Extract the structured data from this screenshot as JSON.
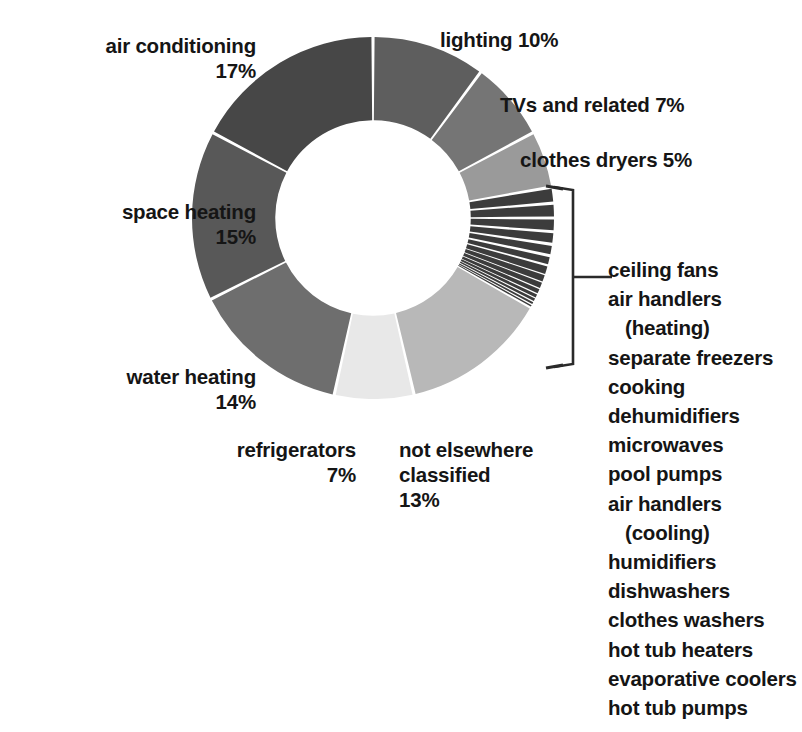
{
  "chart_data": {
    "type": "pie",
    "title": "",
    "subtitle": "",
    "xlabel": "",
    "ylabel": "",
    "donut": true,
    "inner_radius_ratio": 0.54,
    "start_angle_deg": 0,
    "direction": "clockwise",
    "units": "percent",
    "legend_position": "labels-around-chart",
    "grid": false,
    "categories": [
      "lighting",
      "TVs and related",
      "clothes dryers",
      "ceiling fans",
      "air handlers (heating)",
      "separate freezers",
      "cooking",
      "dehumidifiers",
      "microwaves",
      "pool pumps",
      "air handlers (cooling)",
      "humidifiers",
      "dishwashers",
      "clothes washers",
      "hot tub heaters",
      "evaporative coolers",
      "hot tub pumps",
      "not elsewhere classified",
      "refrigerators",
      "water heating",
      "space heating",
      "air conditioning"
    ],
    "values": [
      10,
      7,
      5,
      1.4,
      1.3,
      1.2,
      1.1,
      1.0,
      0.9,
      0.8,
      0.7,
      0.6,
      0.5,
      0.4,
      0.35,
      0.3,
      0.25,
      13,
      7,
      14,
      15,
      17
    ],
    "colors": [
      "#5e5e5e",
      "#757575",
      "#9a9a9a",
      "#3c3c3c",
      "#3c3c3c",
      "#3c3c3c",
      "#3c3c3c",
      "#3c3c3c",
      "#3c3c3c",
      "#3c3c3c",
      "#3c3c3c",
      "#3c3c3c",
      "#3c3c3c",
      "#3c3c3c",
      "#3c3c3c",
      "#3c3c3c",
      "#3c3c3c",
      "#b8b8b8",
      "#e8e8e8",
      "#6e6e6e",
      "#585858",
      "#474747"
    ],
    "labeled_slices": [
      {
        "name": "air conditioning",
        "value": 17,
        "label": "air conditioning\n17%"
      },
      {
        "name": "space heating",
        "value": 15,
        "label": "space heating\n15%"
      },
      {
        "name": "water heating",
        "value": 14,
        "label": "water heating\n14%"
      },
      {
        "name": "refrigerators",
        "value": 7,
        "label": "refrigerators\n7%"
      },
      {
        "name": "not elsewhere classified",
        "value": 13,
        "label": "not elsewhere\nclassified\n13%"
      },
      {
        "name": "lighting",
        "value": 10,
        "label": "lighting 10%"
      },
      {
        "name": "TVs and related",
        "value": 7,
        "label": "TVs and related 7%"
      },
      {
        "name": "clothes dryers",
        "value": 5,
        "label": "clothes dryers 5%"
      }
    ],
    "bracketed_group": {
      "count": 14,
      "items": [
        "ceiling fans",
        "air handlers",
        "(heating)",
        "separate freezers",
        "cooking",
        "dehumidifiers",
        "microwaves",
        "pool pumps",
        "air handlers",
        "(cooling)",
        "humidifiers",
        "dishwashers",
        "clothes washers",
        "hot tub heaters",
        "evaporative coolers",
        "hot tub pumps"
      ]
    }
  },
  "labels": {
    "air_conditioning": "air conditioning\n17%",
    "space_heating": "space heating\n15%",
    "water_heating": "water heating\n14%",
    "refrigerators": "refrigerators\n7%",
    "not_elsewhere_classified": "not elsewhere\nclassified\n13%",
    "lighting": "lighting 10%",
    "tvs_and_related": "TVs and related 7%",
    "clothes_dryers": "clothes dryers 5%"
  },
  "sublist": {
    "items": [
      {
        "text": "ceiling fans",
        "indent": false
      },
      {
        "text": "air handlers",
        "indent": false
      },
      {
        "text": "(heating)",
        "indent": true
      },
      {
        "text": "separate freezers",
        "indent": false
      },
      {
        "text": "cooking",
        "indent": false
      },
      {
        "text": "dehumidifiers",
        "indent": false
      },
      {
        "text": "microwaves",
        "indent": false
      },
      {
        "text": "pool pumps",
        "indent": false
      },
      {
        "text": "air handlers",
        "indent": false
      },
      {
        "text": "(cooling)",
        "indent": true
      },
      {
        "text": "humidifiers",
        "indent": false
      },
      {
        "text": "dishwashers",
        "indent": false
      },
      {
        "text": "clothes washers",
        "indent": false
      },
      {
        "text": "hot tub heaters",
        "indent": false
      },
      {
        "text": "evaporative coolers",
        "indent": false
      },
      {
        "text": "hot tub pumps",
        "indent": false
      }
    ]
  },
  "colors": {
    "background": "#ffffff",
    "text": "#151515",
    "gap": "#ffffff",
    "bracket": "#2a2a2a",
    "air_conditioning": "#474747",
    "space_heating": "#585858",
    "water_heating": "#6e6e6e",
    "refrigerators": "#e8e8e8",
    "not_elsewhere_classified": "#b8b8b8",
    "lighting": "#5e5e5e",
    "tvs_and_related": "#757575",
    "clothes_dryers": "#9a9a9a",
    "small_slices": "#3c3c3c"
  }
}
